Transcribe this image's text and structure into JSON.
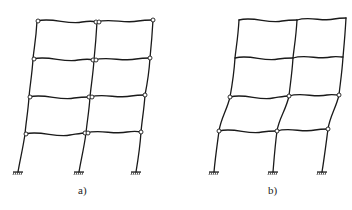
{
  "figure": {
    "panels": [
      {
        "id": "a",
        "label": "a)",
        "description": "Frame with plastic hinges at beam ends on all floors",
        "levels": [
          {
            "y": 22,
            "nodes": [
              [
                37,
                21
              ],
              [
                97,
                22
              ],
              [
                153,
                20
              ]
            ]
          },
          {
            "y": 60,
            "nodes": [
              [
                33,
                59
              ],
              [
                94,
                60
              ],
              [
                150,
                58
              ]
            ]
          },
          {
            "y": 97,
            "nodes": [
              [
                29,
                97
              ],
              [
                90,
                97
              ],
              [
                145,
                95
              ]
            ]
          },
          {
            "y": 133,
            "nodes": [
              [
                25,
                134
              ],
              [
                86,
                133
              ],
              [
                141,
                132
              ]
            ]
          }
        ],
        "supports": [
          [
            18,
            172
          ],
          [
            79,
            172
          ],
          [
            136,
            172
          ]
        ],
        "hinges_at_beams": true,
        "hinges_at_column_base": false
      },
      {
        "id": "b",
        "label": "b)",
        "description": "Frame with plastic hinges forming a storey mechanism",
        "levels": [
          {
            "y": 20,
            "nodes": [
              [
                239,
                20
              ],
              [
                297,
                20
              ],
              [
                346,
                18
              ]
            ]
          },
          {
            "y": 58,
            "nodes": [
              [
                235,
                58
              ],
              [
                293,
                58
              ],
              [
                343,
                57
              ]
            ]
          },
          {
            "y": 97,
            "nodes": [
              [
                230,
                97
              ],
              [
                289,
                96
              ],
              [
                339,
                95
              ]
            ]
          },
          {
            "y": 131,
            "nodes": [
              [
                219,
                131
              ],
              [
                277,
                131
              ],
              [
                328,
                129
              ]
            ]
          }
        ],
        "supports": [
          [
            214,
            172
          ],
          [
            273,
            172
          ],
          [
            322,
            172
          ]
        ],
        "hinged_levels": [
          3
        ]
      }
    ]
  },
  "labels": {
    "a": "a)",
    "b": "b)"
  },
  "colors": {
    "line": "#1a1a1a",
    "background": "#ffffff"
  }
}
